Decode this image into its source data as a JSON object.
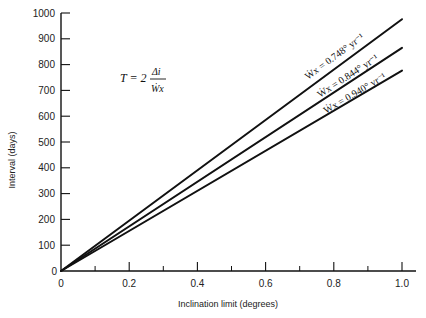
{
  "chart_data": {
    "type": "line",
    "title": "",
    "xlabel": "Inclination limit (degrees)",
    "ylabel": "Interval (days)",
    "xlim": [
      0,
      1.0
    ],
    "ylim": [
      0,
      1000
    ],
    "x_ticks": [
      "0",
      "0.2",
      "0.4",
      "0.6",
      "0.8",
      "1.0"
    ],
    "x_minor_ticks": [
      0.1,
      0.3,
      0.5,
      0.7,
      0.9
    ],
    "y_ticks": [
      "0",
      "100",
      "200",
      "300",
      "400",
      "500",
      "600",
      "700",
      "800",
      "900",
      "1000"
    ],
    "grid": false,
    "legend": "inline labels along lines",
    "annotation": {
      "formula": "T = 2 Δi / Ẇx",
      "lhs": "T = 2",
      "numerator": "Δi",
      "denominator": "Ẇx"
    },
    "series": [
      {
        "name": "Ẇx = 0.748°yr⁻¹",
        "label": "Ẇx = 0.748° yr⁻¹",
        "x": [
          0,
          1.0
        ],
        "values": [
          0,
          976
        ]
      },
      {
        "name": "Ẇx = 0.844°yr⁻¹",
        "label": "Ẇx = 0.844° yr⁻¹",
        "x": [
          0,
          1.0
        ],
        "values": [
          0,
          865
        ]
      },
      {
        "name": "Ẇx = 0.940°yr⁻¹",
        "label": "Ẇx = 0.940° yr⁻¹",
        "x": [
          0,
          1.0
        ],
        "values": [
          0,
          777
        ]
      }
    ]
  },
  "labels": {
    "y_origin": "0",
    "x_origin": "0"
  }
}
